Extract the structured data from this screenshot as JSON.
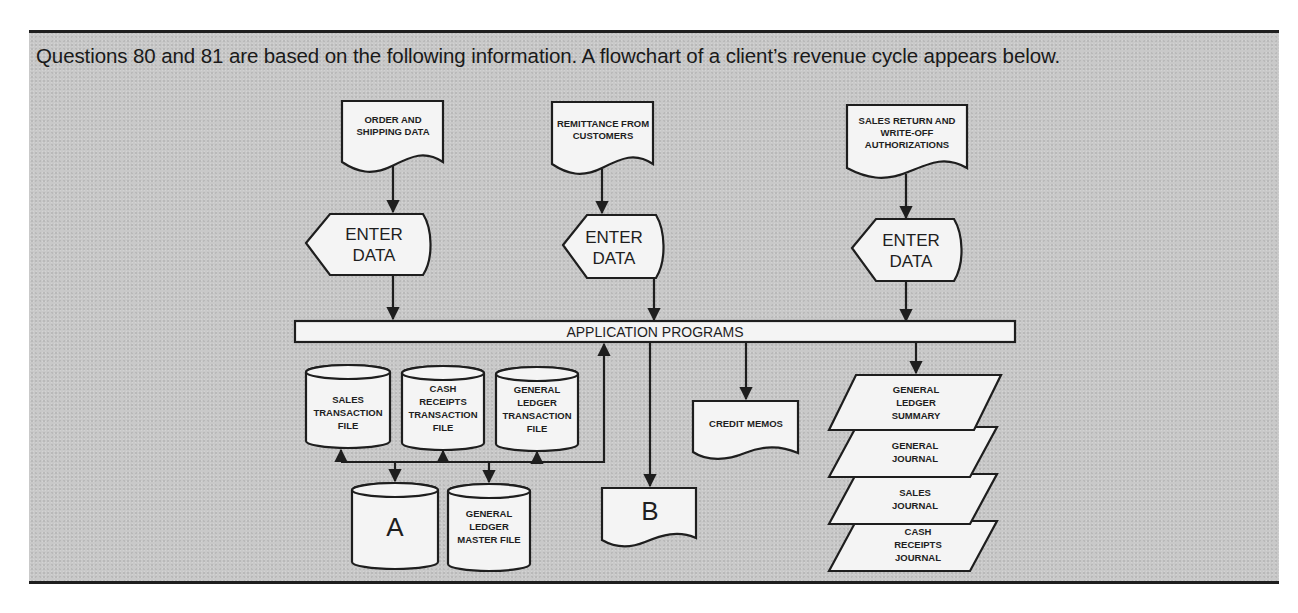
{
  "intro": "Questions 80 and 81 are based on the following information.  A flowchart of a client’s revenue cycle appears below.",
  "inputs": [
    {
      "lines": [
        "ORDER AND",
        "SHIPPING DATA"
      ]
    },
    {
      "lines": [
        "REMITTANCE FROM",
        "CUSTOMERS"
      ]
    },
    {
      "lines": [
        "SALES RETURN AND",
        "WRITE-OFF",
        "AUTHORIZATIONS"
      ]
    }
  ],
  "enter_data": [
    {
      "lines": [
        "ENTER",
        "DATA"
      ]
    },
    {
      "lines": [
        "ENTER",
        "DATA"
      ]
    },
    {
      "lines": [
        "ENTER",
        "DATA"
      ]
    }
  ],
  "process": {
    "label": "APPLICATION PROGRAMS"
  },
  "transaction_files": [
    {
      "lines": [
        "SALES",
        "TRANSACTION",
        "FILE"
      ]
    },
    {
      "lines": [
        "CASH",
        "RECEIPTS",
        "TRANSACTION",
        "FILE"
      ]
    },
    {
      "lines": [
        "GENERAL",
        "LEDGER",
        "TRANSACTION",
        "FILE"
      ]
    }
  ],
  "master_files": [
    {
      "lines": [
        "A"
      ]
    },
    {
      "lines": [
        "GENERAL",
        "LEDGER",
        "MASTER FILE"
      ]
    }
  ],
  "outputs": {
    "document_b": {
      "lines": [
        "B"
      ]
    },
    "credit_memos": {
      "lines": [
        "CREDIT MEMOS"
      ]
    }
  },
  "reports": [
    {
      "lines": [
        "GENERAL",
        "LEDGER",
        "SUMMARY"
      ]
    },
    {
      "lines": [
        "GENERAL",
        "JOURNAL"
      ]
    },
    {
      "lines": [
        "SALES",
        "JOURNAL"
      ]
    },
    {
      "lines": [
        "CASH",
        "RECEIPTS",
        "JOURNAL"
      ]
    }
  ]
}
